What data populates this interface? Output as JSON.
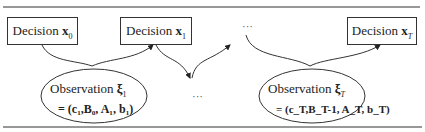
{
  "decisions": [
    {
      "label": "Decision",
      "var": "x",
      "sub": "0"
    },
    {
      "label": "Decision",
      "var": "x",
      "sub": "1"
    },
    {
      "label": "Decision",
      "var": "x",
      "sub": "T"
    }
  ],
  "observations": [
    {
      "label": "Observation",
      "var": "ξ",
      "sub": "1",
      "line2": "= (c₁,B₀, A₁, b₁)"
    },
    {
      "label": "Observation",
      "var": "ξ",
      "sub": "T",
      "line2": "= (c_T,B_T-1, A_T, b_T)"
    }
  ],
  "ellipsis_top": "···",
  "ellipsis_bottom": "···"
}
